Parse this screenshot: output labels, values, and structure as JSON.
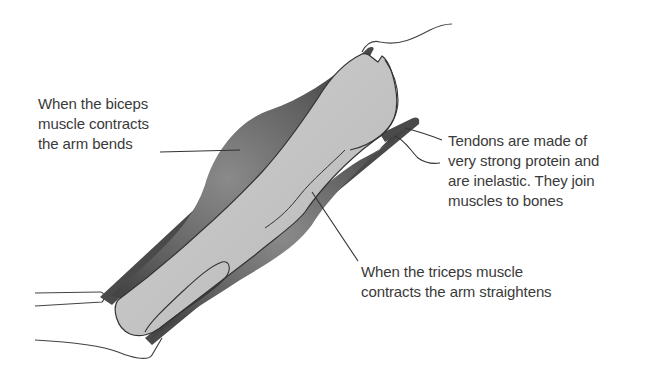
{
  "diagram": {
    "labels": {
      "biceps": {
        "lines": [
          "When the biceps",
          "muscle contracts",
          "the arm bends"
        ]
      },
      "tendons": {
        "lines": [
          "Tendons are made of",
          "very strong protein and",
          "are inelastic. They join",
          "muscles to bones"
        ]
      },
      "triceps": {
        "lines": [
          "When the triceps muscle",
          "contracts the arm straightens"
        ]
      }
    },
    "parts": [
      "biceps-muscle",
      "triceps-muscle",
      "humerus-bone",
      "tendons",
      "shoulder",
      "elbow"
    ],
    "colors": {
      "muscle_dark": "#4a4a4a",
      "muscle_mid": "#7a7a7a",
      "bone": "#c4c4c4",
      "outline": "#333333",
      "text": "#3a3a3a"
    }
  }
}
